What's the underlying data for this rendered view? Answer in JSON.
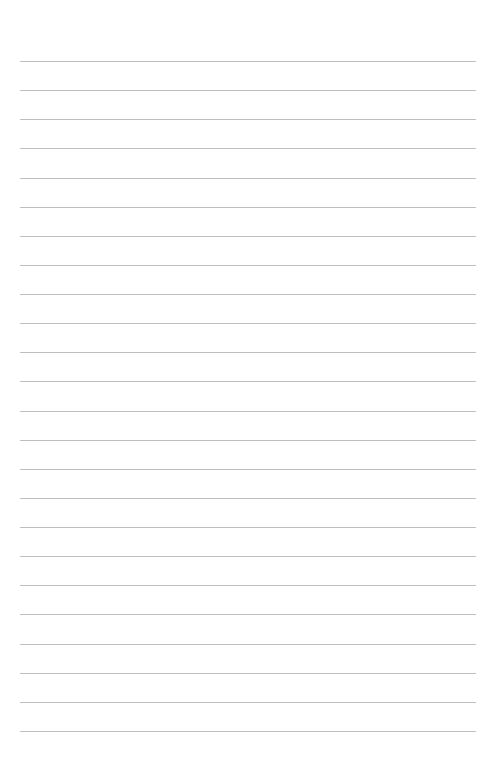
{
  "page": {
    "type": "lined-paper",
    "background_color": "#ffffff",
    "rule_color": "#bfbfbf",
    "rule_count": 24,
    "rule_left": 20,
    "rule_width": 456,
    "first_rule_y": 61,
    "rule_spacing": 29.13,
    "text": []
  }
}
